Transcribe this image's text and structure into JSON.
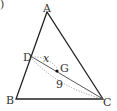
{
  "diagram": {
    "type": "geometry-triangle",
    "corner_mark": ")",
    "points": {
      "A": {
        "label": "A"
      },
      "B": {
        "label": "B"
      },
      "C": {
        "label": "C"
      },
      "D": {
        "label": "D"
      },
      "G": {
        "label": "G"
      }
    },
    "measures": {
      "DG": {
        "label": "x"
      },
      "DC": {
        "label": "9"
      }
    },
    "colors": {
      "stroke": "#222222",
      "dotted": "#888888",
      "text": "#333333"
    }
  }
}
